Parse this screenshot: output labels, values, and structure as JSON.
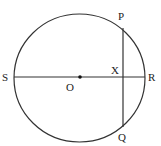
{
  "diagram": {
    "type": "circle-geometry",
    "colors": {
      "stroke": "#333333",
      "background": "#ffffff"
    },
    "labels": {
      "P": "P",
      "Q": "Q",
      "R": "R",
      "S": "S",
      "O": "O",
      "X": "X"
    },
    "points": {
      "O": [
        80,
        77
      ],
      "S": [
        14,
        77
      ],
      "R": [
        145,
        77
      ],
      "P": [
        123,
        28
      ],
      "Q": [
        123,
        127
      ],
      "X": [
        123,
        77
      ]
    },
    "segments": [
      {
        "name": "diameter-SR",
        "from": "S",
        "to": "R"
      },
      {
        "name": "chord-PQ",
        "from": "P",
        "to": "Q"
      }
    ]
  }
}
